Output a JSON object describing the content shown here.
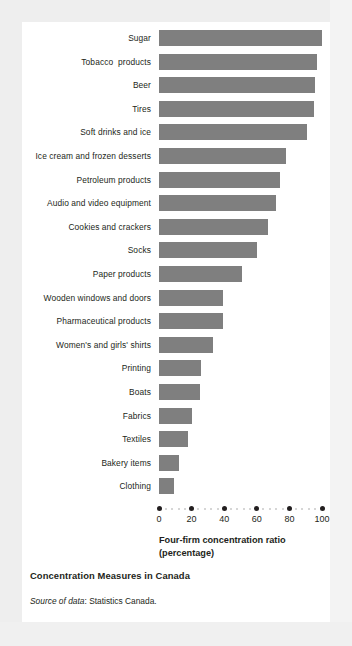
{
  "figure": {
    "title": "Concentration Measures in Canada",
    "source_label": "Source of data",
    "source_sep": ": ",
    "source_value": "Statistics Canada.",
    "bar_color": "#7f7f7f",
    "text_color": "#231f20",
    "card_background": "#ffffff",
    "page_background": "#eeeeee"
  },
  "axis": {
    "title_line1": "Four-firm concentration ratio",
    "title_line2": "(percentage)",
    "ticks": [
      "0",
      "20",
      "40",
      "60",
      "80",
      "100"
    ],
    "tick_values": [
      0,
      20,
      40,
      60,
      80,
      100
    ],
    "minor_step": 4
  },
  "chart_data": {
    "type": "bar",
    "orientation": "horizontal",
    "title": "Concentration Measures in Canada",
    "xlabel": "Four-firm concentration ratio (percentage)",
    "ylabel": "",
    "xlim": [
      0,
      100
    ],
    "grid": false,
    "legend": "none",
    "categories": [
      "Sugar",
      "Tobacco  products",
      "Beer",
      "Tires",
      "Soft drinks and ice",
      "Ice cream and frozen desserts",
      "Petroleum products",
      "Audio and video equipment",
      "Cookies and crackers",
      "Socks",
      "Paper products",
      "Wooden windows and doors",
      "Pharmaceutical products",
      "Women's and girls' shirts",
      "Printing",
      "Boats",
      "Fabrics",
      "Textiles",
      "Bakery items",
      "Clothing"
    ],
    "values": [
      100,
      97,
      96,
      95,
      91,
      78,
      74,
      72,
      67,
      60,
      51,
      39,
      39,
      33,
      26,
      25,
      20,
      18,
      12,
      9
    ],
    "annotations": []
  }
}
